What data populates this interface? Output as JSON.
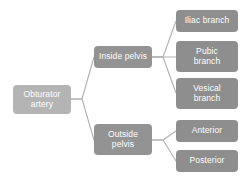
{
  "diagram": {
    "type": "tree",
    "orientation": "left-to-right",
    "background_color": "#ffffff",
    "connector_color": "#b0b0b0",
    "root": {
      "id": "obturator-artery",
      "label": "Obturator\nartery",
      "color": "#b4b4b4",
      "text_color": "#ffffff"
    },
    "branches": [
      {
        "id": "inside-pelvis",
        "label": "Inside pelvis",
        "color": "#939393",
        "text_color": "#ffffff",
        "children": [
          {
            "id": "iliac-branch",
            "label": "Iliac branch",
            "color": "#8e8e8e",
            "text_color": "#ffffff"
          },
          {
            "id": "pubic-branch",
            "label": "Pubic\nbranch",
            "color": "#8e8e8e",
            "text_color": "#ffffff"
          },
          {
            "id": "vesical-branch",
            "label": "Vesical\nbranch",
            "color": "#8e8e8e",
            "text_color": "#ffffff"
          }
        ]
      },
      {
        "id": "outside-pelvis",
        "label": "Outside\npelvis",
        "color": "#939393",
        "text_color": "#ffffff",
        "children": [
          {
            "id": "anterior",
            "label": "Anterior",
            "color": "#8e8e8e",
            "text_color": "#ffffff"
          },
          {
            "id": "posterior",
            "label": "Posterior",
            "color": "#8e8e8e",
            "text_color": "#ffffff"
          }
        ]
      }
    ]
  }
}
